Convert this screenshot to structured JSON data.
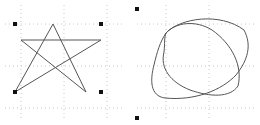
{
  "canvas": {
    "width": 260,
    "height": 125,
    "background": "#ffffff"
  },
  "colors": {
    "grid": "#c8c8c8",
    "stroke": "#555555",
    "handle": "#111111"
  },
  "left_panel": {
    "shape": "star",
    "grid_x": [
      21,
      64,
      107
    ],
    "grid_y": [
      24,
      66,
      108
    ],
    "star_points": "53,24 86,92 21,40 101,40 15,92 53,24",
    "handles": [
      [
        15,
        24
      ],
      [
        101,
        24
      ],
      [
        15,
        92
      ],
      [
        101,
        92
      ]
    ]
  },
  "right_panel": {
    "shape": "overlapping-ellipses",
    "grid_x": [
      166,
      209
    ],
    "grid_y": [
      24,
      66,
      108
    ],
    "handles": [
      [
        137,
        9
      ],
      [
        137,
        118
      ]
    ]
  }
}
